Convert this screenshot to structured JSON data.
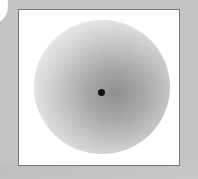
{
  "scene": {
    "background_color": "#c4c4c4",
    "frame_border_color": "#777777",
    "frame_fill_color": "#ffffff",
    "gradient": {
      "center_color": "#8f8f8f",
      "edge_color": "#ffffff"
    },
    "dot_color": "#111111"
  }
}
